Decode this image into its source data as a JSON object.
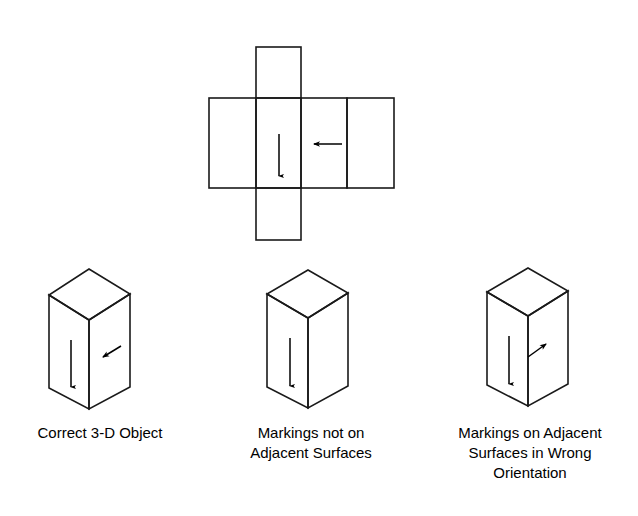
{
  "figure": {
    "stroke_color": "#1a1a1a",
    "background_color": "#ffffff",
    "arrow_color": "#000000"
  },
  "net": {
    "name": "unfolded-cube-net",
    "description": "Cross-shaped unfolded net of a rectangular box with two arrow markings",
    "faces": [
      {
        "id": "face-top-flap",
        "x": 256,
        "y": 47,
        "w": 45,
        "h": 51
      },
      {
        "id": "face-left",
        "x": 209,
        "y": 98,
        "w": 47,
        "h": 90
      },
      {
        "id": "face-center",
        "x": 256,
        "y": 98,
        "w": 45,
        "h": 90
      },
      {
        "id": "face-right",
        "x": 301,
        "y": 98,
        "w": 46,
        "h": 90
      },
      {
        "id": "face-far-right",
        "x": 347,
        "y": 98,
        "w": 47,
        "h": 90
      },
      {
        "id": "face-bottom-flap",
        "x": 256,
        "y": 188,
        "w": 45,
        "h": 52
      }
    ],
    "markings": [
      {
        "id": "net-down-arrow",
        "type": "arrow-down",
        "x1": 279,
        "y1": 134,
        "x2": 279,
        "y2": 178
      },
      {
        "id": "net-left-arrow",
        "type": "arrow-left",
        "x1": 342,
        "y1": 144,
        "x2": 312,
        "y2": 144
      }
    ]
  },
  "objects": [
    {
      "id": "object-correct",
      "name": "correct-3d-object",
      "caption": "Correct 3-D Object",
      "caption_lines": [
        "Correct 3-D Object"
      ],
      "box": {
        "apex_x": 89,
        "apex_y": 269,
        "left_x": 49,
        "left_y": 295,
        "right_x": 130,
        "right_y": 294,
        "front_x": 89,
        "front_y": 320,
        "bottom_left_y": 388,
        "bottom_right_y": 387,
        "front_bottom_y": 409
      },
      "markings": [
        {
          "id": "down-arrow",
          "type": "arrow-down",
          "x1": 71,
          "y1": 340,
          "x2": 71,
          "y2": 389
        },
        {
          "id": "diagonal-arrow",
          "type": "arrow-diagonal-down-left",
          "x1": 121,
          "y1": 346,
          "x2": 101,
          "y2": 358
        }
      ]
    },
    {
      "id": "object-not-adjacent",
      "name": "markings-not-adjacent-object",
      "caption": "Markings not on Adjacent Surfaces",
      "caption_lines": [
        "Markings not on",
        "Adjacent Surfaces"
      ],
      "box": {
        "apex_x": 308,
        "apex_y": 270,
        "left_x": 267,
        "left_y": 294,
        "right_x": 348,
        "right_y": 293,
        "front_x": 308,
        "front_y": 318,
        "bottom_left_y": 387,
        "bottom_right_y": 386,
        "front_bottom_y": 408
      },
      "markings": [
        {
          "id": "down-arrow",
          "type": "arrow-down",
          "x1": 290,
          "y1": 338,
          "x2": 290,
          "y2": 388
        }
      ]
    },
    {
      "id": "object-wrong-orientation",
      "name": "markings-wrong-orientation-object",
      "caption": "Markings on Adjacent Surfaces in Wrong Orientation",
      "caption_lines": [
        "Markings on Adjacent",
        "Surfaces in Wrong",
        "Orientation"
      ],
      "box": {
        "apex_x": 528,
        "apex_y": 268,
        "left_x": 487,
        "left_y": 292,
        "right_x": 568,
        "right_y": 291,
        "front_x": 528,
        "front_y": 316,
        "bottom_left_y": 385,
        "bottom_right_y": 384,
        "front_bottom_y": 406
      },
      "markings": [
        {
          "id": "down-arrow",
          "type": "arrow-down",
          "x1": 509,
          "y1": 336,
          "x2": 509,
          "y2": 386
        },
        {
          "id": "diagonal-arrow",
          "type": "arrow-diagonal-up-right",
          "x1": 528,
          "y1": 356,
          "x2": 548,
          "y2": 342
        }
      ]
    }
  ],
  "captions": {
    "object1_line1": "Correct 3-D Object",
    "object2_line1": "Markings not on",
    "object2_line2": "Adjacent Surfaces",
    "object3_line1": "Markings on Adjacent",
    "object3_line2": "Surfaces in Wrong",
    "object3_line3": "Orientation"
  }
}
